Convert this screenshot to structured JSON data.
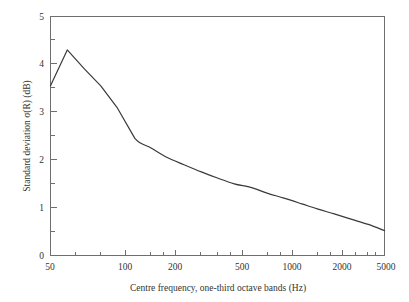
{
  "chart_data": {
    "type": "line",
    "title": "",
    "xlabel": "Centre frequency, one-third octave bands (Hz)",
    "ylabel_prefix": "Standard deviation ",
    "ylabel_symbol": "σ(R)",
    "ylabel_suffix": " (dB)",
    "ylabel_full": "Standard deviation σ(R) (dB)",
    "xscale": "log",
    "yscale": "linear",
    "xlim": [
      50,
      5000
    ],
    "ylim": [
      0,
      5
    ],
    "grid": false,
    "legend": false,
    "x_tick_labels": [
      "50",
      "100",
      "200",
      "500",
      "1000",
      "2000",
      "5000"
    ],
    "x_tick_values": [
      50,
      100,
      200,
      500,
      1000,
      2000,
      5000
    ],
    "x_minor_ticks": [
      63,
      80,
      125,
      160,
      250,
      315,
      400,
      630,
      800,
      1250,
      1600,
      2500,
      3150,
      4000
    ],
    "y_tick_labels": [
      "0",
      "1",
      "2",
      "3",
      "4",
      "5"
    ],
    "y_tick_values": [
      0,
      1,
      2,
      3,
      4,
      5
    ],
    "y_minor_ticks": [
      0.5,
      1.5,
      2.5,
      3.5,
      4.5
    ],
    "series": [
      {
        "name": "Standard deviation of R",
        "x": [
          50,
          63,
          80,
          100,
          125,
          160,
          200,
          250,
          315,
          400,
          500,
          630,
          800,
          1000,
          1250,
          1600,
          2000,
          2500,
          3150,
          4000,
          5000
        ],
        "values": [
          3.55,
          4.3,
          3.9,
          3.55,
          3.1,
          2.45,
          2.25,
          2.05,
          1.9,
          1.75,
          1.62,
          1.5,
          1.42,
          1.3,
          1.2,
          1.08,
          0.97,
          0.87,
          0.76,
          0.65,
          0.52
        ]
      }
    ]
  },
  "axis": {
    "x_title": "Centre frequency, one-third octave bands (Hz)",
    "y_title": "Standard deviation σ(R) (dB)"
  }
}
